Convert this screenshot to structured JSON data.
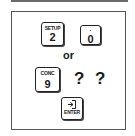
{
  "keypad_instruction": {
    "step1": {
      "keys": [
        {
          "legend": "SETUP",
          "main": "2"
        },
        {
          "legend": "·",
          "main": "0"
        }
      ]
    },
    "separator": "or",
    "step2": {
      "key": {
        "legend": "CONC",
        "main": "9"
      },
      "placeholder": "? ?"
    },
    "step3": {
      "key": {
        "icon": "enter-arrow-icon",
        "legend": "ENTER"
      }
    }
  }
}
